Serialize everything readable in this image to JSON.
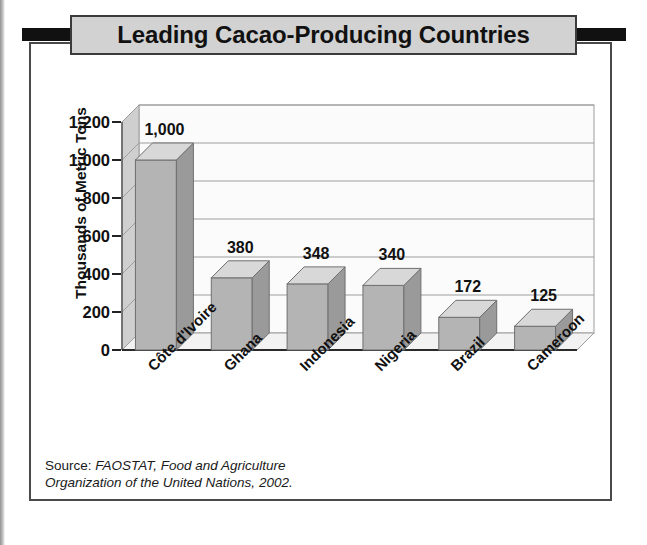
{
  "title": "Leading Cacao-Producing Countries",
  "source": {
    "lead": "Source:",
    "italic_line1": "FAOSTAT, Food and Agriculture",
    "italic_line2": "Organization of the United Nations,",
    "year": "2002."
  },
  "colors": {
    "title_box_fill": "#d2d2d2",
    "title_box_border": "#3b3b3b",
    "frame_border": "#4a4a4a",
    "bar_front": "#b4b4b4",
    "bar_side": "#9a9a9a",
    "bar_top": "#d8d8d8",
    "wall_left": "#cfcfcf",
    "floor": "#f2f2f2",
    "gridline": "#9d9d9d",
    "plot_bg": "#fbfbfb",
    "text": "#111111"
  },
  "chart_data": {
    "type": "bar",
    "title": "Leading Cacao-Producing Countries",
    "xlabel": "",
    "ylabel": "Thousands of Metric Tons",
    "categories": [
      "Côte d'Ivoire",
      "Ghana",
      "Indonesia",
      "Nigeria",
      "Brazil",
      "Cameroon"
    ],
    "values": [
      1000,
      380,
      348,
      340,
      172,
      125
    ],
    "value_labels": [
      "1,000",
      "380",
      "348",
      "340",
      "172",
      "125"
    ],
    "ylim": [
      0,
      1200
    ],
    "ytick_values": [
      0,
      200,
      400,
      600,
      800,
      1000,
      1200
    ],
    "ytick_labels": [
      "0",
      "200",
      "400",
      "600",
      "800",
      "1,000",
      "1,200"
    ],
    "grid": true,
    "legend": false,
    "style": "3d-column",
    "units": "thousands of metric tons"
  }
}
